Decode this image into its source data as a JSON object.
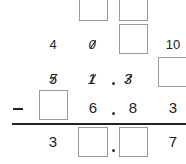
{
  "problem": {
    "type": "decimal subtraction with borrowing",
    "borrow_row_top": {
      "boxes": [
        "",
        ""
      ]
    },
    "borrow_row": {
      "digits": [
        "4",
        "0",
        "",
        "10"
      ],
      "struck": [
        false,
        true,
        false,
        false
      ]
    },
    "minuend": {
      "digits": [
        "5",
        "1",
        ".",
        "3",
        ""
      ],
      "struck": [
        true,
        true,
        false,
        true,
        false
      ]
    },
    "operator": "−",
    "subtrahend": {
      "digits": [
        "",
        "6",
        ".",
        "8",
        "3"
      ]
    },
    "difference": {
      "digits": [
        "3",
        "",
        ".",
        "",
        "7"
      ]
    }
  }
}
